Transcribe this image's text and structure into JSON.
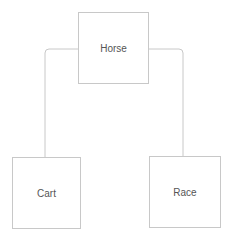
{
  "diagram": {
    "type": "tree",
    "nodes": [
      {
        "id": "horse",
        "label": "Horse"
      },
      {
        "id": "cart",
        "label": "Cart"
      },
      {
        "id": "race",
        "label": "Race"
      }
    ],
    "edges": [
      {
        "from": "horse",
        "to": "cart"
      },
      {
        "from": "horse",
        "to": "race"
      }
    ],
    "colors": {
      "border": "#c8c8c8",
      "text": "#555555",
      "background": "#ffffff"
    }
  }
}
